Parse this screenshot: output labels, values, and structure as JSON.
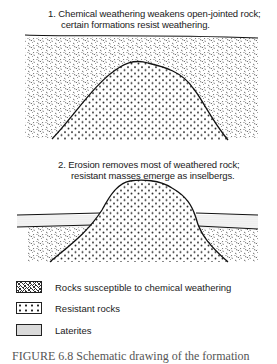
{
  "panel1": {
    "caption_line1": "1. Chemical weathering weakens open-jointed rock;",
    "caption_line2": "certain formations resist weathering."
  },
  "panel2": {
    "caption_line1": "2. Erosion removes most of weathered rock;",
    "caption_line2": "resistant masses emerge as inselbergs."
  },
  "legend": {
    "items": [
      {
        "pattern": "weathering-pattern",
        "label": "Rocks susceptible to chemical weathering"
      },
      {
        "pattern": "resistant-dot-pattern",
        "label": "Resistant rocks"
      },
      {
        "pattern": "laterite-stipple-pattern",
        "label": "Laterites"
      }
    ]
  },
  "figure_caption": "FIGURE 6.8  Schematic drawing of the formation"
}
